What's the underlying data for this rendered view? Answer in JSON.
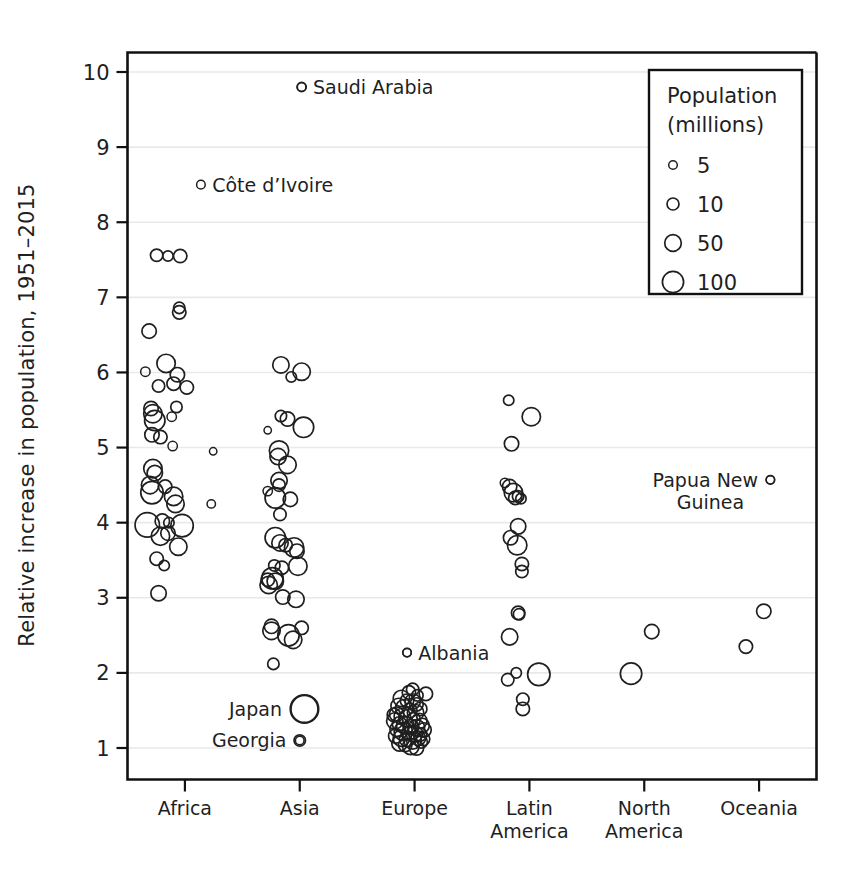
{
  "chart_data": {
    "type": "scatter",
    "title": "",
    "xlabel": "",
    "ylabel": "Relative increase in population, 1951–2015",
    "categories": [
      "Africa",
      "Asia",
      "Europe",
      "Latin America",
      "North America",
      "Oceania"
    ],
    "ylim": [
      0.6,
      10.35
    ],
    "yticks": [
      1,
      2,
      3,
      4,
      5,
      6,
      7,
      8,
      9,
      10
    ],
    "ytick_labels": [
      "1",
      "2",
      "3",
      "4",
      "5",
      "6",
      "7",
      "8",
      "9",
      "10"
    ],
    "grid": "horizontal",
    "size_encoding": "population in millions (marker radius)",
    "legend": {
      "title_line1": "Population",
      "title_line2": "(millions)",
      "position": "top-right inside plot",
      "entries": [
        {
          "label": "5",
          "value": 5
        },
        {
          "label": "10",
          "value": 10
        },
        {
          "label": "50",
          "value": 50
        },
        {
          "label": "100",
          "value": 100
        }
      ]
    },
    "annotations": [
      {
        "label": "Saudi Arabia",
        "category": "Asia",
        "y": 9.8,
        "pop": 5,
        "align": "left"
      },
      {
        "label": "Côte d’Ivoire",
        "category": "Africa",
        "y": 8.5,
        "pop": 5,
        "align": "left"
      },
      {
        "label": "Papua New",
        "label2": "Guinea",
        "category": "Oceania",
        "y": 4.57,
        "pop": 5,
        "align": "right"
      },
      {
        "label": "Albania",
        "category": "Europe",
        "y": 2.27,
        "pop": 4,
        "align": "left"
      },
      {
        "label": "Japan",
        "category": "Asia",
        "y": 1.52,
        "pop": 100,
        "align": "right"
      },
      {
        "label": "Georgia",
        "category": "Asia",
        "y": 1.1,
        "pop": 5,
        "align": "right"
      }
    ],
    "series": [
      {
        "name": "Africa",
        "points": [
          [
            -0.3,
            7.56,
            8
          ],
          [
            -0.18,
            7.55,
            6
          ],
          [
            -0.05,
            7.55,
            9
          ],
          [
            -0.06,
            6.86,
            7
          ],
          [
            -0.06,
            6.8,
            9
          ],
          [
            -0.38,
            6.55,
            10
          ],
          [
            -0.42,
            6.01,
            5
          ],
          [
            -0.2,
            6.12,
            14
          ],
          [
            -0.08,
            5.97,
            10
          ],
          [
            -0.28,
            5.82,
            8
          ],
          [
            -0.12,
            5.85,
            9
          ],
          [
            0.02,
            5.8,
            9
          ],
          [
            -0.09,
            5.54,
            7
          ],
          [
            -0.14,
            5.41,
            5
          ],
          [
            -0.36,
            5.52,
            10
          ],
          [
            -0.34,
            5.45,
            14
          ],
          [
            -0.32,
            5.36,
            16
          ],
          [
            -0.35,
            5.17,
            10
          ],
          [
            -0.26,
            5.14,
            9
          ],
          [
            -0.13,
            5.02,
            5
          ],
          [
            0.3,
            4.95,
            3
          ],
          [
            -0.34,
            4.72,
            14
          ],
          [
            -0.32,
            4.66,
            11
          ],
          [
            -0.37,
            4.5,
            13
          ],
          [
            -0.35,
            4.4,
            18
          ],
          [
            -0.21,
            4.48,
            9
          ],
          [
            -0.12,
            4.35,
            14
          ],
          [
            -0.1,
            4.25,
            13
          ],
          [
            0.28,
            4.25,
            4
          ],
          [
            -0.24,
            4.02,
            10
          ],
          [
            -0.17,
            4.0,
            6
          ],
          [
            -0.4,
            3.97,
            20
          ],
          [
            -0.03,
            3.96,
            18
          ],
          [
            -0.26,
            3.82,
            14
          ],
          [
            -0.18,
            3.86,
            10
          ],
          [
            -0.07,
            3.68,
            13
          ],
          [
            -0.3,
            3.52,
            9
          ],
          [
            -0.22,
            3.43,
            6
          ],
          [
            -0.28,
            3.06,
            11
          ]
        ]
      },
      {
        "name": "Asia",
        "points": [
          [
            0.02,
            9.8,
            5
          ],
          [
            -0.2,
            6.1,
            12
          ],
          [
            -0.09,
            5.94,
            6
          ],
          [
            0.02,
            6.01,
            13
          ],
          [
            -0.2,
            5.42,
            7
          ],
          [
            -0.13,
            5.38,
            10
          ],
          [
            0.04,
            5.27,
            16
          ],
          [
            -0.34,
            5.23,
            3
          ],
          [
            -0.22,
            4.96,
            15
          ],
          [
            -0.23,
            4.88,
            12
          ],
          [
            -0.13,
            4.77,
            13
          ],
          [
            -0.22,
            4.56,
            12
          ],
          [
            -0.22,
            4.5,
            8
          ],
          [
            -0.34,
            4.42,
            5
          ],
          [
            -0.26,
            4.33,
            16
          ],
          [
            -0.1,
            4.31,
            10
          ],
          [
            -0.21,
            4.11,
            8
          ],
          [
            -0.26,
            3.8,
            16
          ],
          [
            -0.21,
            3.73,
            12
          ],
          [
            -0.15,
            3.7,
            9
          ],
          [
            -0.06,
            3.67,
            15
          ],
          [
            -0.03,
            3.62,
            10
          ],
          [
            -0.27,
            3.43,
            7
          ],
          [
            -0.19,
            3.4,
            9
          ],
          [
            -0.02,
            3.42,
            14
          ],
          [
            -0.29,
            3.26,
            17
          ],
          [
            -0.26,
            3.22,
            12
          ],
          [
            -0.34,
            3.24,
            9
          ],
          [
            -0.33,
            3.17,
            13
          ],
          [
            -0.18,
            3.01,
            10
          ],
          [
            -0.04,
            2.98,
            12
          ],
          [
            -0.3,
            2.62,
            10
          ],
          [
            -0.3,
            2.56,
            13
          ],
          [
            -0.12,
            2.5,
            17
          ],
          [
            -0.07,
            2.44,
            13
          ],
          [
            0.02,
            2.6,
            9
          ],
          [
            -0.28,
            2.12,
            7
          ],
          [
            0.05,
            1.52,
            24
          ],
          [
            0.0,
            1.1,
            7
          ]
        ]
      },
      {
        "name": "Europe",
        "points": [
          [
            -0.08,
            2.27,
            4
          ],
          [
            0.12,
            1.72,
            9
          ],
          [
            -0.02,
            1.78,
            8
          ],
          [
            -0.06,
            1.74,
            9
          ],
          [
            0.03,
            1.7,
            7
          ],
          [
            -0.14,
            1.66,
            12
          ],
          [
            -0.08,
            1.63,
            9
          ],
          [
            -0.02,
            1.62,
            11
          ],
          [
            0.02,
            1.58,
            9
          ],
          [
            -0.17,
            1.56,
            11
          ],
          [
            -0.11,
            1.53,
            13
          ],
          [
            -0.05,
            1.5,
            10
          ],
          [
            0.01,
            1.47,
            12
          ],
          [
            0.06,
            1.52,
            9
          ],
          [
            -0.19,
            1.45,
            10
          ],
          [
            -0.13,
            1.42,
            12
          ],
          [
            -0.07,
            1.39,
            14
          ],
          [
            -0.01,
            1.38,
            9
          ],
          [
            0.05,
            1.36,
            11
          ],
          [
            -0.21,
            1.36,
            12
          ],
          [
            -0.16,
            1.32,
            10
          ],
          [
            -0.1,
            1.3,
            13
          ],
          [
            -0.04,
            1.28,
            11
          ],
          [
            0.02,
            1.27,
            12
          ],
          [
            0.08,
            1.3,
            10
          ],
          [
            -0.18,
            1.25,
            11
          ],
          [
            -0.12,
            1.22,
            14
          ],
          [
            -0.06,
            1.2,
            10
          ],
          [
            0.0,
            1.19,
            12
          ],
          [
            0.06,
            1.18,
            9
          ],
          [
            -0.2,
            1.16,
            10
          ],
          [
            -0.14,
            1.13,
            12
          ],
          [
            -0.08,
            1.12,
            11
          ],
          [
            -0.02,
            1.1,
            13
          ],
          [
            0.04,
            1.13,
            10
          ],
          [
            -0.16,
            1.06,
            11
          ],
          [
            -0.1,
            1.04,
            9
          ],
          [
            -0.04,
            1.02,
            12
          ],
          [
            0.02,
            1.0,
            10
          ],
          [
            0.07,
            1.08,
            8
          ],
          [
            -0.22,
            1.44,
            9
          ],
          [
            0.1,
            1.24,
            10
          ],
          [
            0.09,
            1.12,
            9
          ]
        ]
      },
      {
        "name": "Latin America",
        "points": [
          [
            -0.22,
            5.63,
            6
          ],
          [
            0.02,
            5.41,
            14
          ],
          [
            -0.19,
            5.05,
            10
          ],
          [
            -0.26,
            4.53,
            5
          ],
          [
            -0.21,
            4.48,
            10
          ],
          [
            -0.17,
            4.4,
            14
          ],
          [
            -0.12,
            4.35,
            7
          ],
          [
            -0.15,
            4.33,
            9
          ],
          [
            -0.09,
            4.32,
            6
          ],
          [
            -0.12,
            3.95,
            11
          ],
          [
            -0.2,
            3.8,
            10
          ],
          [
            -0.13,
            3.7,
            15
          ],
          [
            -0.08,
            3.45,
            9
          ],
          [
            -0.08,
            3.35,
            8
          ],
          [
            -0.12,
            2.8,
            9
          ],
          [
            -0.11,
            2.78,
            7
          ],
          [
            -0.21,
            2.48,
            12
          ],
          [
            -0.23,
            1.91,
            8
          ],
          [
            -0.14,
            2.0,
            6
          ],
          [
            0.1,
            1.98,
            18
          ],
          [
            -0.07,
            1.65,
            8
          ],
          [
            -0.07,
            1.52,
            9
          ]
        ]
      },
      {
        "name": "North America",
        "points": [
          [
            0.08,
            2.55,
            10
          ],
          [
            -0.14,
            1.99,
            17
          ]
        ]
      },
      {
        "name": "Oceania",
        "points": [
          [
            0.12,
            4.57,
            4
          ],
          [
            0.05,
            2.82,
            10
          ],
          [
            -0.14,
            2.35,
            9
          ]
        ]
      }
    ]
  }
}
